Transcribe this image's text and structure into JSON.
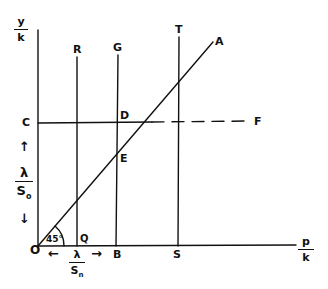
{
  "diagram": {
    "axes": {
      "y_label_num": "y",
      "y_label_den": "k",
      "x_label_num": "p",
      "x_label_den": "k"
    },
    "points": {
      "origin": "O",
      "C": "C",
      "D": "D",
      "E": "E",
      "F": "F",
      "R": "R",
      "G": "G",
      "T": "T",
      "A": "A",
      "Q": "Q",
      "B": "B",
      "S": "S"
    },
    "angle_label": "45",
    "angle_degree": "°",
    "vertical_interval": {
      "numerator": "λ",
      "denominator": "S",
      "denominator_sub": "o",
      "arrow_up": "↑",
      "arrow_down": "↓"
    },
    "horizontal_interval": {
      "numerator": "λ",
      "denominator": "S",
      "denominator_sub": "n",
      "arrow_left": "←",
      "arrow_right": "→"
    },
    "colors": {
      "ink": "#111111",
      "paper": "#ffffff"
    }
  }
}
